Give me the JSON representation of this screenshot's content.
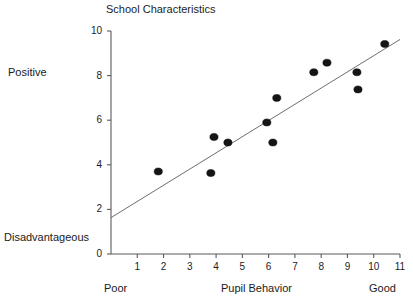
{
  "chart_data": {
    "type": "scatter",
    "title": "School Characteristics",
    "xlabel": "Pupil Behavior",
    "ylabel": "School Characteristics",
    "xlim": [
      0,
      11
    ],
    "ylim": [
      0,
      10
    ],
    "grid": false,
    "legend": null,
    "x_axis_end_labels": {
      "left": "Poor",
      "right": "Good"
    },
    "y_axis_end_labels": {
      "high": "Positive",
      "low": "Disadvantageous"
    },
    "xticks": [
      1,
      2,
      3,
      4,
      5,
      6,
      7,
      8,
      9,
      10,
      11
    ],
    "xtick_labels": [
      "1",
      "2",
      "3",
      "4",
      "5",
      "6",
      "7",
      "8",
      "9",
      "10",
      "11"
    ],
    "yticks": [
      0,
      2,
      4,
      6,
      8,
      10
    ],
    "ytick_labels": [
      "0",
      "2",
      "4",
      "6",
      "8",
      "10"
    ],
    "marker": "filled-circle",
    "marker_color": "#151515",
    "points": [
      {
        "x": 1.8,
        "y": 3.7
      },
      {
        "x": 3.8,
        "y": 3.63
      },
      {
        "x": 3.92,
        "y": 5.25
      },
      {
        "x": 4.45,
        "y": 5.0
      },
      {
        "x": 5.93,
        "y": 5.9
      },
      {
        "x": 6.16,
        "y": 5.0
      },
      {
        "x": 6.31,
        "y": 7.0
      },
      {
        "x": 7.72,
        "y": 8.15
      },
      {
        "x": 8.22,
        "y": 8.58
      },
      {
        "x": 9.36,
        "y": 8.15
      },
      {
        "x": 9.4,
        "y": 7.38
      },
      {
        "x": 10.42,
        "y": 9.42
      }
    ],
    "trendline": {
      "type": "linear",
      "x_start": 0.0,
      "y_start": 1.63,
      "x_end": 11.0,
      "y_end": 9.62,
      "color": "#6e6e6e"
    },
    "axis_color": "#5a5a5a"
  }
}
